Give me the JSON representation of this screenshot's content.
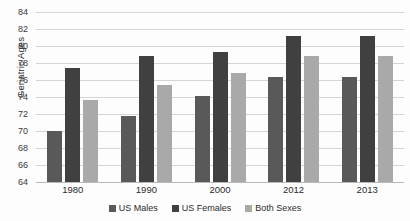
{
  "chart_data": {
    "type": "bar",
    "title": "",
    "xlabel": "",
    "ylabel": "Geriatric Ages",
    "categories": [
      "1980",
      "1990",
      "2000",
      "2012",
      "2013"
    ],
    "series": [
      {
        "name": "US Males",
        "color": "#595959",
        "values": [
          70.0,
          71.8,
          74.1,
          76.4,
          76.4
        ]
      },
      {
        "name": "US Females",
        "color": "#404040",
        "values": [
          77.4,
          78.8,
          79.3,
          81.2,
          81.2
        ]
      },
      {
        "name": "Both Sexes",
        "color": "#a9a9a9",
        "values": [
          73.7,
          75.4,
          76.8,
          78.8,
          78.8
        ]
      }
    ],
    "ylim": [
      64,
      84
    ],
    "ytick_step": 2,
    "yticks": [
      "64",
      "66",
      "68",
      "70",
      "72",
      "74",
      "76",
      "78",
      "80",
      "82",
      "84"
    ],
    "grid": true,
    "legend_position": "bottom"
  }
}
